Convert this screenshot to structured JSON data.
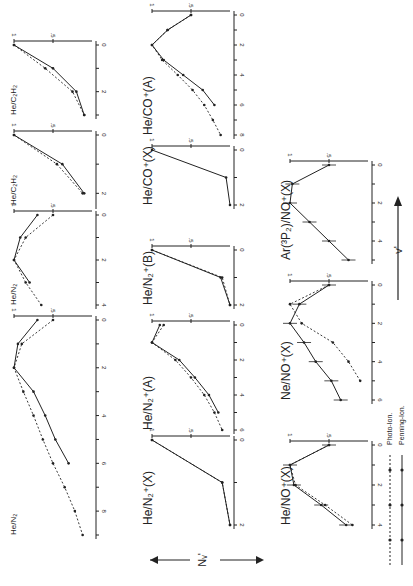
{
  "figure": {
    "ylabel": "N_v'",
    "xlabel": "v'",
    "legend": [
      {
        "label": "Photo-Ion.",
        "style": "dotted"
      },
      {
        "label": "Penning-Ion.",
        "style": "solid"
      }
    ],
    "colors": {
      "ink": "#222222",
      "background": "#ffffff"
    }
  },
  "chart_data": [
    {
      "type": "line",
      "title": "He/N2",
      "xlabel": "v'",
      "ylabel": "N_v'",
      "xlim": [
        0,
        9
      ],
      "ylim": [
        0,
        1
      ],
      "series": [
        {
          "name": "Penning-Ion.",
          "x": [
            0,
            1,
            2,
            3,
            4,
            5,
            6
          ],
          "values": [
            0.7,
            0.95,
            1.0,
            0.75,
            0.6,
            0.47,
            0.3
          ]
        },
        {
          "name": "Photo-Ion.",
          "x": [
            0,
            1,
            2,
            3,
            4,
            5,
            6,
            7,
            8,
            9
          ],
          "values": [
            0.5,
            0.9,
            1.0,
            0.88,
            0.75,
            0.63,
            0.5,
            0.35,
            0.22,
            0.12
          ]
        }
      ]
    },
    {
      "type": "line",
      "title": "He/N2 (top, clipped)",
      "xlabel": "v'",
      "ylabel": "N_v'",
      "xlim": [
        0,
        4
      ],
      "ylim": [
        0,
        1
      ],
      "series": [
        {
          "name": "Penning-Ion.",
          "x": [
            0,
            1,
            2,
            3
          ],
          "values": [
            0.7,
            0.92,
            1.0,
            0.8
          ]
        },
        {
          "name": "Photo-Ion.",
          "x": [
            0,
            1,
            2,
            3,
            4
          ],
          "values": [
            0.5,
            0.85,
            1.0,
            0.85,
            0.65
          ]
        }
      ]
    },
    {
      "type": "line",
      "title": "He/C2H2 (top, clipped)",
      "xlabel": "v'",
      "ylabel": "N_v'",
      "xlim": [
        0,
        2
      ],
      "ylim": [
        0,
        1
      ],
      "series": [
        {
          "name": "Penning-Ion.",
          "x": [
            0,
            1,
            2
          ],
          "values": [
            1.0,
            0.38,
            0.1
          ]
        },
        {
          "name": "Photo-Ion.",
          "x": [
            0,
            1,
            2
          ],
          "values": [
            1.0,
            0.45,
            0.12
          ]
        }
      ]
    },
    {
      "type": "line",
      "title": "He/C2H2 (top, clipped 2)",
      "xlabel": "v'",
      "ylabel": "N_v'",
      "xlim": [
        0,
        3
      ],
      "ylim": [
        0,
        1
      ],
      "series": [
        {
          "name": "Penning-Ion.",
          "x": [
            0,
            1,
            2,
            3
          ],
          "values": [
            1.0,
            0.5,
            0.2,
            0.1
          ]
        },
        {
          "name": "Photo-Ion.",
          "x": [
            0,
            1,
            2,
            3
          ],
          "values": [
            1.0,
            0.6,
            0.25,
            0.1
          ]
        }
      ]
    },
    {
      "type": "line",
      "title": "He/N2+(X)",
      "xlabel": "v'",
      "ylabel": "N_v'",
      "xlim": [
        0,
        2
      ],
      "ylim": [
        0,
        1
      ],
      "series": [
        {
          "name": "Penning-Ion.",
          "x": [
            0,
            1,
            2
          ],
          "values": [
            1.0,
            0.1,
            0.0
          ]
        },
        {
          "name": "Photo-Ion.",
          "x": [
            0,
            1,
            2
          ],
          "values": [
            1.0,
            0.1,
            0.0
          ]
        }
      ]
    },
    {
      "type": "line",
      "title": "He/N2+(A)",
      "xlabel": "v'",
      "ylabel": "N_v'",
      "xlim": [
        0,
        6
      ],
      "ylim": [
        0,
        1
      ],
      "series": [
        {
          "name": "Penning-Ion.",
          "x": [
            0,
            1,
            2,
            3,
            4,
            5
          ],
          "values": [
            0.9,
            1.0,
            0.65,
            0.45,
            0.27,
            0.15
          ]
        },
        {
          "name": "Photo-Ion.",
          "x": [
            0,
            1,
            2,
            3,
            4,
            5,
            6
          ],
          "values": [
            0.85,
            1.0,
            0.7,
            0.5,
            0.33,
            0.2,
            0.1
          ]
        }
      ]
    },
    {
      "type": "line",
      "title": "He/N2+(B)",
      "xlabel": "v'",
      "ylabel": "N_v'",
      "xlim": [
        0,
        2
      ],
      "ylim": [
        0,
        1
      ],
      "series": [
        {
          "name": "Penning-Ion.",
          "x": [
            0,
            1,
            2
          ],
          "values": [
            1.0,
            0.12,
            0.0
          ]
        },
        {
          "name": "Photo-Ion.",
          "x": [
            0,
            1,
            2
          ],
          "values": [
            1.0,
            0.1,
            0.0
          ]
        }
      ]
    },
    {
      "type": "line",
      "title": "He/CO+(X)",
      "xlabel": "v'",
      "ylabel": "N_v'",
      "xlim": [
        0,
        2
      ],
      "ylim": [
        0,
        1
      ],
      "series": [
        {
          "name": "Penning-Ion.",
          "x": [
            0,
            1,
            2
          ],
          "values": [
            1.0,
            0.05,
            0.0
          ]
        }
      ]
    },
    {
      "type": "line",
      "title": "He/CO+(A)",
      "xlabel": "v'",
      "ylabel": "N_v'",
      "xlim": [
        0,
        8
      ],
      "ylim": [
        0,
        1
      ],
      "series": [
        {
          "name": "Penning-Ion.",
          "x": [
            0,
            1,
            2,
            3,
            4,
            5,
            6
          ],
          "values": [
            0.5,
            0.8,
            1.0,
            0.85,
            0.6,
            0.35,
            0.2
          ]
        },
        {
          "name": "Photo-Ion.",
          "x": [
            0,
            1,
            2,
            3,
            4,
            5,
            6,
            7,
            8
          ],
          "values": [
            0.5,
            0.8,
            1.0,
            0.87,
            0.67,
            0.48,
            0.33,
            0.22,
            0.12
          ]
        }
      ]
    },
    {
      "type": "line",
      "title": "He/NO+(X)",
      "xlabel": "v'",
      "ylabel": "N_v'",
      "xlim": [
        0,
        4
      ],
      "ylim": [
        0,
        1
      ],
      "series": [
        {
          "name": "Penning-Ion.",
          "x": [
            0,
            1,
            2,
            3,
            4
          ],
          "values": [
            0.5,
            1.0,
            0.95,
            0.6,
            0.28
          ]
        },
        {
          "name": "Photo-Ion.",
          "x": [
            0,
            1,
            2,
            3,
            4
          ],
          "values": [
            0.5,
            1.0,
            0.93,
            0.55,
            0.2
          ]
        }
      ]
    },
    {
      "type": "line",
      "title": "Ne/NO+(X)",
      "xlabel": "v'",
      "ylabel": "N_v'",
      "xlim": [
        0,
        6
      ],
      "ylim": [
        0,
        1
      ],
      "series": [
        {
          "name": "Penning-Ion.",
          "x": [
            0,
            1,
            2,
            3,
            4,
            5,
            6
          ],
          "values": [
            0.5,
            0.88,
            1.0,
            0.82,
            0.67,
            0.47,
            0.35
          ]
        },
        {
          "name": "Photo-Ion.",
          "x": [
            0,
            1,
            2,
            3,
            4,
            5
          ],
          "values": [
            0.5,
            1.0,
            0.85,
            0.45,
            0.25,
            0.1
          ]
        }
      ]
    },
    {
      "type": "line",
      "title": "Ar(3P2)/NO+(X)",
      "xlabel": "v'",
      "ylabel": "N_v'",
      "xlim": [
        0,
        4
      ],
      "ylim": [
        0,
        1
      ],
      "series": [
        {
          "name": "Penning-Ion.",
          "x": [
            0,
            1,
            2,
            3,
            4,
            5
          ],
          "values": [
            0.5,
            0.97,
            1.0,
            0.75,
            0.5,
            0.25
          ]
        }
      ]
    }
  ]
}
